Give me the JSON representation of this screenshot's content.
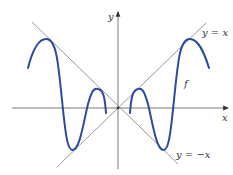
{
  "figure": {
    "axes": {
      "x_label": "x",
      "y_label": "y"
    },
    "lines": [
      {
        "id": "y-equals-x",
        "label": "y = x",
        "slope": 1
      },
      {
        "id": "y-equals-neg-x",
        "label": "y = −x",
        "slope": -1
      }
    ],
    "curve": {
      "label": "f",
      "description": "even oscillating function bounded by y = x and y = −x, touching y = |x| at maxima and y = −|x| at minima",
      "color": "#2b4aa0"
    },
    "colors": {
      "axis": "#7a7a7a",
      "guide_lines": "#8c8c8c",
      "curve": "#2b4aa0"
    }
  }
}
